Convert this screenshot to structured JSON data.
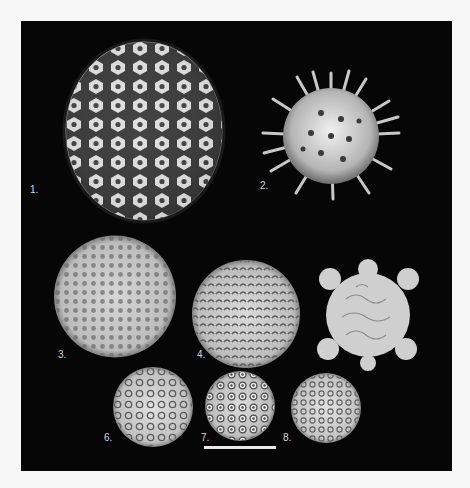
{
  "figure": {
    "panel_background": "#060606",
    "page_background": "#f7f7f7",
    "labels": [
      "1.",
      "2.",
      "3.",
      "4.",
      "5.",
      "6.",
      "7.",
      "8."
    ],
    "scale_bar": {
      "visible": true,
      "color": "#e8e8e8"
    }
  }
}
